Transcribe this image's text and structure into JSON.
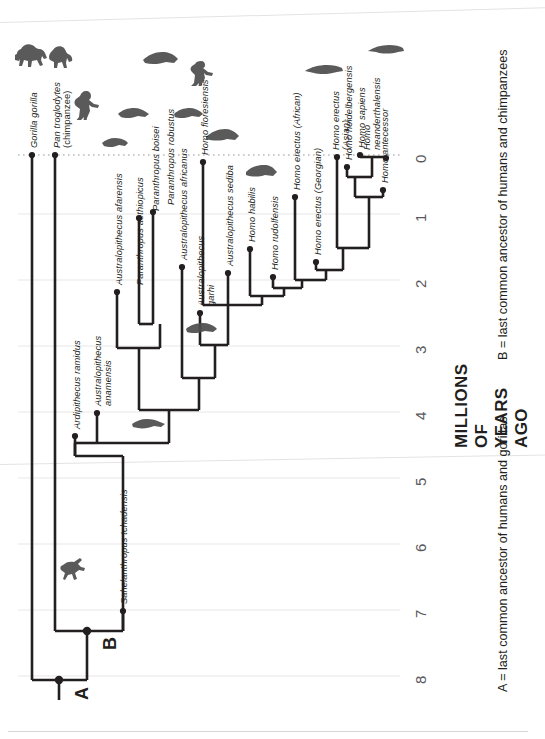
{
  "figure": {
    "type": "cladogram",
    "axis_title": "MILLIONS OF YEARS AGO",
    "axis_ticks": [
      "0",
      "1",
      "2",
      "3",
      "4",
      "5",
      "6",
      "7",
      "8"
    ],
    "axis_range_mya": [
      0,
      8.3
    ],
    "legend": [
      {
        "key": "A",
        "text": "A = last common ancestor of humans and gorillas"
      },
      {
        "key": "B",
        "text": "B = last common ancestor of humans and chimpanzees"
      }
    ],
    "node_letters": [
      {
        "label": "A",
        "mya": 8.0
      },
      {
        "label": "B",
        "mya": 7.25
      }
    ]
  },
  "taxa": [
    {
      "name": "Gorilla gorilla",
      "tip_mya": 0.0,
      "origin_mya": 8.0,
      "silhouette": "gorilla-silhouette"
    },
    {
      "name": "Pan troglodytes",
      "name2": "(chimpanzee)",
      "tip_mya": 0.0,
      "origin_mya": 7.25,
      "silhouette": "chimpanzee-silhouette"
    },
    {
      "name": "Sahelanthropus tchadensis",
      "tip_mya": 6.9,
      "origin_mya": 7.25,
      "silhouette": "sahelanthropus-silhouette"
    },
    {
      "name": "Ardipithecus ramidus",
      "tip_mya": 4.4,
      "origin_mya": 4.65,
      "silhouette": null
    },
    {
      "name": "Australopithecus anamensis",
      "tip_mya": 4.05,
      "origin_mya": 4.65,
      "silhouette": "anamensis-silhouette"
    },
    {
      "name": "Australopithecus afarensis",
      "tip_mya": 3.0,
      "origin_mya": 4.35,
      "silhouette": "afarensis-silhouette"
    },
    {
      "name": "Paranthropus aethiopicus",
      "tip_mya": 2.3,
      "origin_mya": 2.85,
      "silhouette": "aethiopicus-silhouette"
    },
    {
      "name": "Paranthropus boisei",
      "tip_mya": 1.1,
      "origin_mya": 2.6,
      "silhouette": "boisei-silhouette"
    },
    {
      "name": "Paranthropus robustus",
      "tip_mya": 1.0,
      "origin_mya": 2.6,
      "silhouette": "robustus-silhouette"
    },
    {
      "name": "Australopithecus africanus",
      "tip_mya": 1.8,
      "origin_mya": 4.35,
      "silhouette": null
    },
    {
      "name": "Australopithecus garhi",
      "tip_mya": 2.5,
      "origin_mya": 3.6,
      "silhouette": "garhi-silhouette"
    },
    {
      "name": "Australopithecus sediba",
      "tip_mya": 1.85,
      "origin_mya": 2.5,
      "silhouette": null
    },
    {
      "name": "Homo habilis",
      "tip_mya": 1.5,
      "origin_mya": 2.4,
      "silhouette": "habilis-silhouette"
    },
    {
      "name": "Homo rudolfensis",
      "tip_mya": 1.9,
      "origin_mya": 2.25,
      "silhouette": null
    },
    {
      "name": "Homo floresiensis",
      "tip_mya": 0.1,
      "origin_mya": 2.5,
      "silhouette": "floresiensis-silhouette"
    },
    {
      "name": "Homo erectus (African)",
      "tip_mya": 0.65,
      "origin_mya": 2.05,
      "silhouette": null
    },
    {
      "name": "Homo erectus (Georgian)",
      "tip_mya": 1.65,
      "origin_mya": 1.9,
      "silhouette": null
    },
    {
      "name": "Homo erectus",
      "name2": "(Asian)",
      "tip_mya": 0.05,
      "origin_mya": 1.9,
      "silhouette": "erectus-asian-silhouette"
    },
    {
      "name": "Homo heidelbergensis",
      "tip_mya": 0.35,
      "origin_mya": 1.75,
      "silhouette": null
    },
    {
      "name": "Homo antecessor",
      "tip_mya": 0.65,
      "origin_mya": 1.75,
      "silhouette": null
    },
    {
      "name": "Homo sapiens",
      "tip_mya": 0.0,
      "origin_mya": 0.35,
      "silhouette": "sapiens-silhouette"
    },
    {
      "name": "Homo",
      "name2": "neanderthalensis",
      "tip_mya": 0.03,
      "origin_mya": 0.35,
      "silhouette": "neanderthal-silhouette"
    }
  ],
  "colors": {
    "ink": "#231f20",
    "tick_text": "#58585b",
    "gridline": "#e8e8ea",
    "silhouette": "#4d4d4d",
    "background": "#ffffff"
  }
}
